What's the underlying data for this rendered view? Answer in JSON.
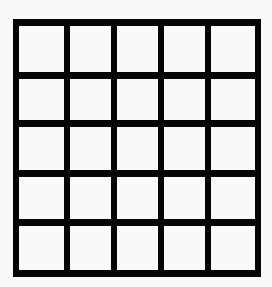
{
  "grid": {
    "rows": 5,
    "columns": 5,
    "line_color": "#050505",
    "cell_color": "#f9f9f9",
    "cells": [
      [
        "",
        "",
        "",
        "",
        ""
      ],
      [
        "",
        "",
        "",
        "",
        ""
      ],
      [
        "",
        "",
        "",
        "",
        ""
      ],
      [
        "",
        "",
        "",
        "",
        ""
      ],
      [
        "",
        "",
        "",
        "",
        ""
      ]
    ]
  }
}
